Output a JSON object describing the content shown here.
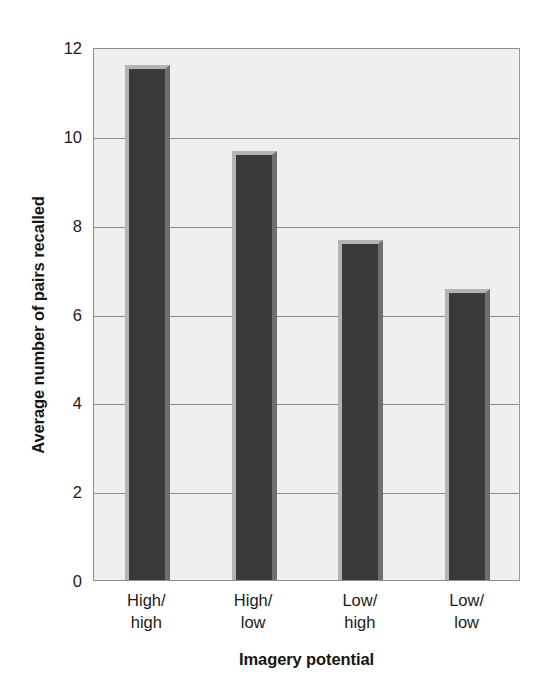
{
  "chart_data": {
    "type": "bar",
    "title": "",
    "xlabel": "Imagery potential",
    "ylabel": "Average number of pairs recalled",
    "categories": [
      "High/\nhigh",
      "High/\nlow",
      "Low/\nhigh",
      "Low/\nlow"
    ],
    "category_lines": [
      [
        "High/",
        "high"
      ],
      [
        "High/",
        "low"
      ],
      [
        "Low/",
        "high"
      ],
      [
        "Low/",
        "low"
      ]
    ],
    "values": [
      11.6,
      9.65,
      7.65,
      6.55
    ],
    "ylim": [
      0,
      12
    ],
    "yticks": [
      0,
      2,
      4,
      6,
      8,
      10,
      12
    ],
    "ytick_labels": [
      "0",
      "2",
      "4",
      "6",
      "8",
      "10",
      "12"
    ],
    "grid": "horizontal",
    "legend": "none",
    "colors": {
      "bar_face": "#3a3a3a",
      "bar_highlight": "#b4b4b4",
      "bar_shade": "#6f6f6f",
      "plot_background": "#efefed",
      "gridline": "#8e8e8e",
      "axis": "#8d8d8d",
      "text": "#1b1b1b",
      "page_background": "#ffffff"
    }
  }
}
